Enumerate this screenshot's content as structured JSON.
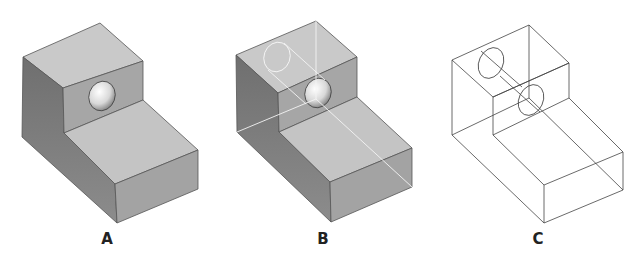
{
  "figures": [
    {
      "id": "A",
      "label": "A",
      "style": "shaded-opaque",
      "label_x": 107
    },
    {
      "id": "B",
      "label": "B",
      "style": "shaded-translucent-hidden-lines",
      "label_x": 323
    },
    {
      "id": "C",
      "label": "C",
      "style": "wireframe",
      "label_x": 538
    }
  ],
  "colors": {
    "top_face": "#c9c9c9",
    "left_face": "#7d7d7d",
    "front_face": "#a6a6a6",
    "edge": "#555555",
    "hidden_line": "#f2f2f2",
    "wire": "#444444"
  }
}
